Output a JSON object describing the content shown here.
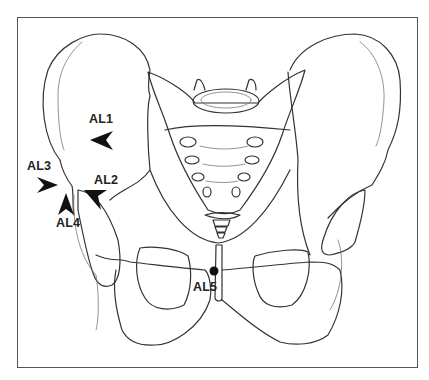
{
  "figure": {
    "frame_color": "#555555",
    "line_color": "#333333",
    "marker_color": "#111111"
  },
  "landmarks": [
    {
      "id": "AL1",
      "label": "AL1",
      "marker": "arrowhead",
      "direction": "left"
    },
    {
      "id": "AL2",
      "label": "AL2",
      "marker": "arrowhead",
      "direction": "up-left"
    },
    {
      "id": "AL3",
      "label": "AL3",
      "marker": "arrowhead",
      "direction": "right"
    },
    {
      "id": "AL4",
      "label": "AL4",
      "marker": "arrowhead",
      "direction": "up"
    },
    {
      "id": "AL5",
      "label": "AL5",
      "marker": "dot",
      "direction": "none"
    }
  ]
}
